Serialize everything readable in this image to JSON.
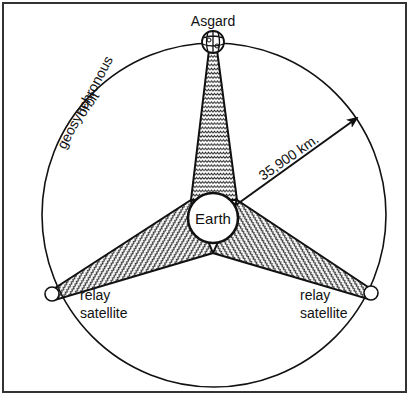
{
  "diagram": {
    "labels": {
      "asgard": "Asgard",
      "earth": "Earth",
      "orbit_line1": "geosynchronous",
      "orbit_line2": "orbit",
      "distance": "35,900  km.",
      "relay_left_line1": "relay",
      "relay_left_line2": "satellite",
      "relay_right_line1": "relay",
      "relay_right_line2": "satellite"
    },
    "colors": {
      "stroke": "#111111",
      "background": "#ffffff",
      "hatch": "#222222"
    },
    "geometry": {
      "frame": {
        "x": 3,
        "y": 3,
        "w": 403,
        "h": 389
      },
      "orbit": {
        "cx": 214,
        "cy": 215,
        "r": 172
      },
      "earth": {
        "cx": 213,
        "cy": 218,
        "r": 25
      },
      "asgard": {
        "cx": 213,
        "cy": 42,
        "r": 11
      },
      "satellite_left": {
        "cx": 52,
        "cy": 294,
        "r": 7
      },
      "satellite_right": {
        "cx": 371,
        "cy": 293,
        "r": 7
      },
      "distance_arrow": {
        "x1": 236,
        "y1": 205,
        "x2": 357,
        "y2": 118
      }
    }
  }
}
